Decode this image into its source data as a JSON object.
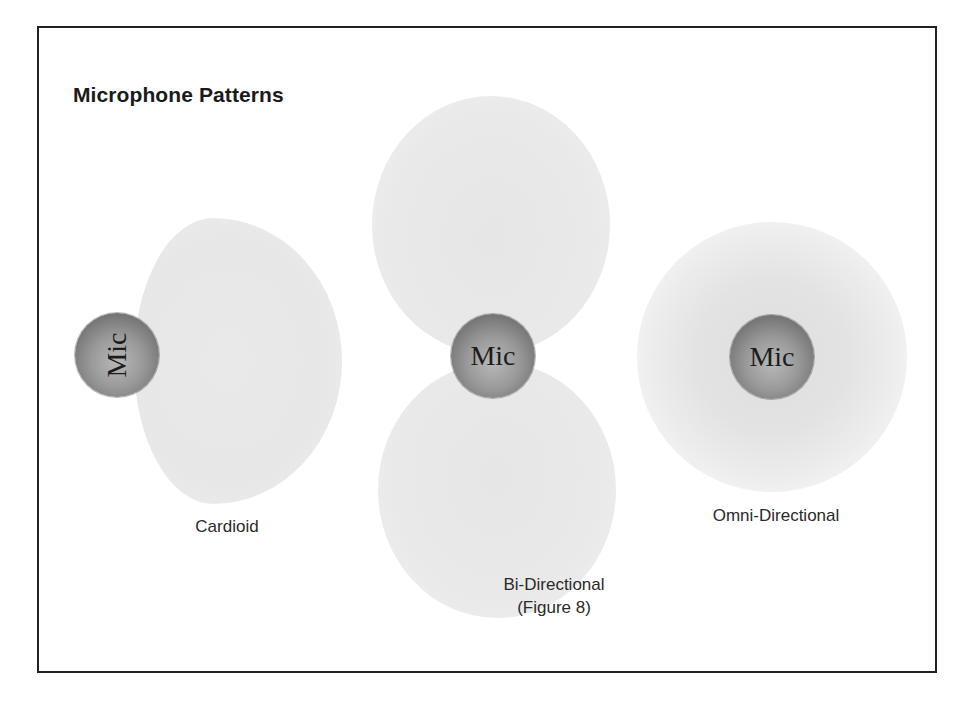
{
  "diagram": {
    "title": "Microphone Patterns",
    "patterns": [
      {
        "id": "cardioid",
        "mic_label": "Mic",
        "caption_lines": [
          "Cardioid"
        ],
        "mic_orientation": "rotated-90-ccw",
        "pickup_shape": "single lobe (heart-shaped) on one side"
      },
      {
        "id": "bi-directional",
        "mic_label": "Mic",
        "caption_lines": [
          "Bi-Directional",
          "(Figure 8)"
        ],
        "mic_orientation": "upright",
        "pickup_shape": "two lobes, front and back"
      },
      {
        "id": "omni-directional",
        "mic_label": "Mic",
        "caption_lines": [
          "Omni-Directional"
        ],
        "mic_orientation": "upright",
        "pickup_shape": "circular field all around"
      }
    ],
    "colors": {
      "frame_border": "#222222",
      "pickup_fill": "#e8e8e8",
      "mic_sphere": "#8a8a8a",
      "text": "#2a2a2a"
    }
  }
}
